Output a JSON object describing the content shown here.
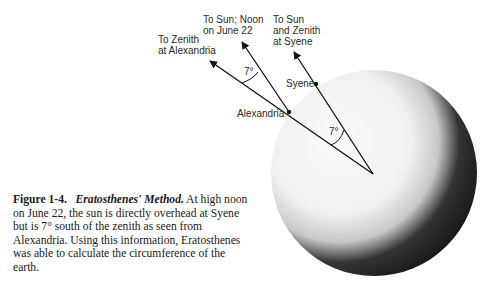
{
  "diagram": {
    "labels": {
      "zenith_alexandria_line1": "To Zenith",
      "zenith_alexandria_line2": "at Alexandria",
      "sun_noon_line1": "To Sun; Noon",
      "sun_noon_line2": "on June 22",
      "sun_syene_line1": "To Sun",
      "sun_syene_line2": "and Zenith",
      "sun_syene_line3": "at Syene",
      "syene": "Syene",
      "alexandria": "Alexandria",
      "angle_top": "7°",
      "angle_center": "7°"
    }
  },
  "caption": {
    "figure": "Figure 1-4.",
    "title": "Eratosthenes' Method.",
    "body": "At high noon on June 22, the sun is directly overhead at Syene but is 7° south of the zenith as seen from Alexandria. Using this information, Eratosthenes was able to calculate the circumference of the earth."
  }
}
